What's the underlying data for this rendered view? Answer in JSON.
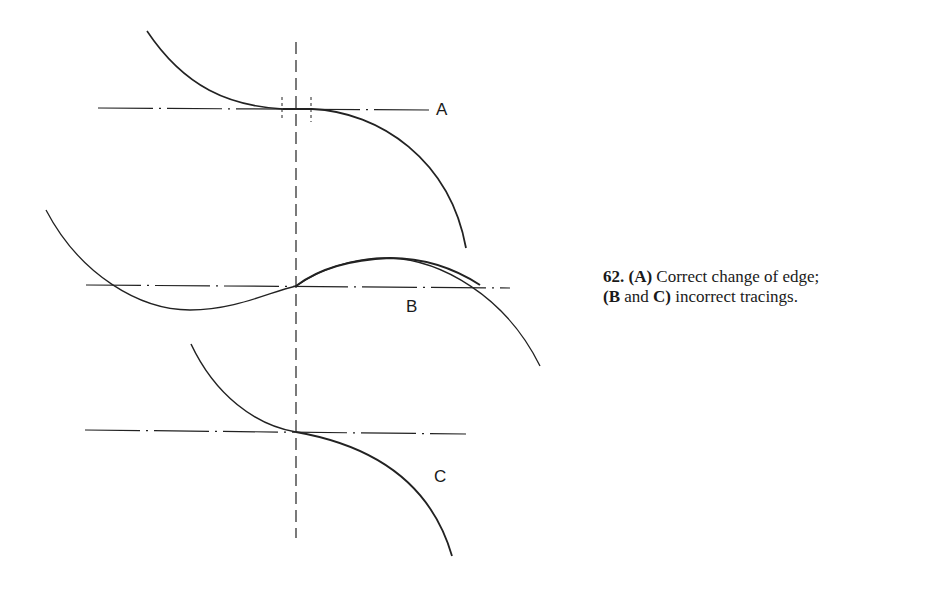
{
  "figure": {
    "number": "62.",
    "labels": {
      "a": "A",
      "b": "B",
      "c": "C"
    },
    "caption": {
      "line1_a": "(A)",
      "line1_text": " Correct change of edge;",
      "line2_bc_open": "(B",
      "line2_and": " and ",
      "line2_c_close": "C)",
      "line2_text": " incorrect tracings."
    }
  }
}
